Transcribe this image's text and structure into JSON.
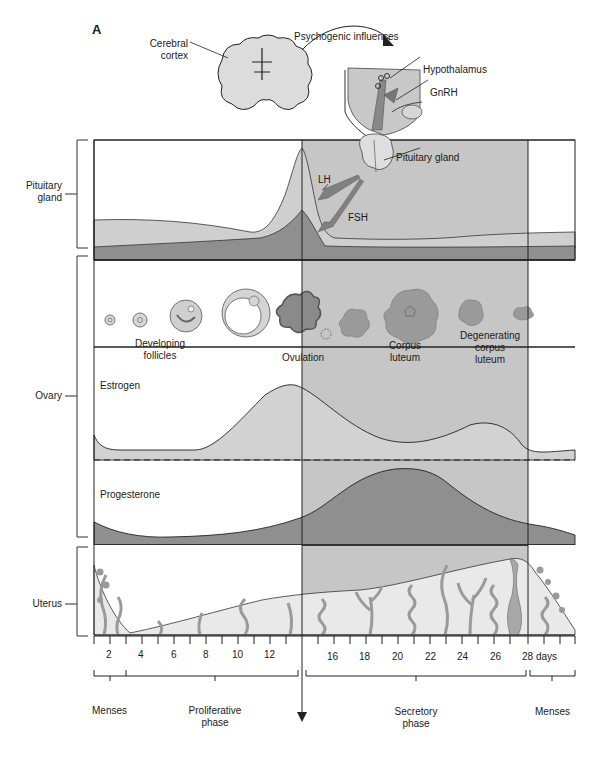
{
  "figure": {
    "panel_letter": "A",
    "top": {
      "cerebral_cortex": [
        "Cerebral",
        "cortex"
      ],
      "psychogenic": "Psychogenic influences",
      "hypothalamus": "Hypothalamus",
      "gnrh": "GnRH",
      "pituitary_gland": "Pituitary gland",
      "lh": "LH",
      "fsh": "FSH"
    },
    "sections": {
      "pituitary": [
        "Pituitary",
        "gland"
      ],
      "ovary": "Ovary",
      "uterus": "Uterus"
    },
    "ovary_labels": {
      "developing": [
        "Developing",
        "follicles"
      ],
      "ovulation": "Ovulation",
      "corpus": [
        "Corpus",
        "luteum"
      ],
      "degenerating": [
        "Degenerating",
        "corpus",
        "luteum"
      ],
      "estrogen": "Estrogen",
      "progesterone": "Progesterone"
    },
    "axis": {
      "ticks": [
        "2",
        "4",
        "6",
        "8",
        "10",
        "12",
        "16",
        "18",
        "20",
        "22",
        "24",
        "26",
        "28 days"
      ]
    },
    "phases": {
      "menses_left": "Menses",
      "proliferative": [
        "Proliferative",
        "phase"
      ],
      "secretory": [
        "Secretory",
        "phase"
      ],
      "menses_right": "Menses"
    },
    "colors": {
      "light_gray": "#d6d6d6",
      "mid_gray": "#bdbdbd",
      "dark_gray": "#8a8a8a",
      "luteal_shade": "#c4c4c4",
      "line": "#222222"
    }
  }
}
